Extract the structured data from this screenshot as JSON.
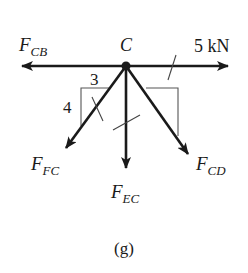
{
  "figure": {
    "caption": "(g)",
    "node": {
      "label": "C",
      "x": 126,
      "y": 66
    },
    "forces": [
      {
        "id": "FCB",
        "main": "F",
        "sub": "CB",
        "direction": "left",
        "tip": [
          22,
          66
        ]
      },
      {
        "id": "P",
        "label": "5 kN",
        "direction": "right",
        "tip": [
          228,
          66
        ]
      },
      {
        "id": "FFC",
        "main": "F",
        "sub": "FC",
        "direction": "down-left",
        "slope": "3:4",
        "tip": [
          66,
          148
        ]
      },
      {
        "id": "FEC",
        "main": "F",
        "sub": "EC",
        "direction": "down",
        "tip": [
          126,
          168
        ]
      },
      {
        "id": "FCD",
        "main": "F",
        "sub": "CD",
        "direction": "down-right",
        "tip": [
          188,
          154
        ]
      }
    ],
    "slope_triangle": {
      "horizontal": "3",
      "vertical": "4"
    },
    "colors": {
      "ink": "#1a1a1a",
      "thin_line": "#555555",
      "background": "#ffffff"
    }
  }
}
